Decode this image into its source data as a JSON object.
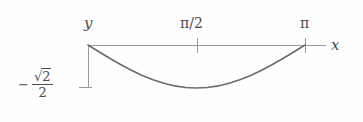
{
  "figure": {
    "background_color": "#fefefe",
    "axis_color": "#9a9a9a",
    "curve_color": "#6b6b6b",
    "text_color": "#4a4a4a"
  },
  "labels": {
    "y_axis": "y",
    "x_axis": "x",
    "tick_pi_half": "π/2",
    "tick_pi": "π",
    "min_value_minus": "−",
    "min_value_numerator_radical": "√",
    "min_value_numerator_arg": "2",
    "min_value_denominator": "2"
  },
  "chart_data": {
    "type": "line",
    "title": "",
    "xlabel": "x",
    "ylabel": "y",
    "xlim": [
      0,
      3.14159
    ],
    "ylim": [
      -0.7071,
      0
    ],
    "grid": false,
    "legend": "none",
    "xticks": [
      1.5708,
      3.14159
    ],
    "xticklabels": [
      "π/2",
      "π"
    ],
    "yticks": [
      -0.7071
    ],
    "yticklabels": [
      "−√2/2"
    ],
    "annotations": [
      {
        "text": "y",
        "x": 0,
        "y": 0,
        "position": "above-left-of-origin"
      },
      {
        "text": "x",
        "x": 3.4,
        "y": 0,
        "position": "right-of-axis-end"
      }
    ],
    "series": [
      {
        "name": "curve",
        "equation": "y = -(sqrt(2)/2) * sin(x)",
        "x": [
          0.0,
          0.1571,
          0.3142,
          0.4712,
          0.6283,
          0.7854,
          0.9425,
          1.0996,
          1.2566,
          1.4137,
          1.5708,
          1.7279,
          1.885,
          2.042,
          2.1991,
          2.3562,
          2.5133,
          2.6704,
          2.8274,
          2.9845,
          3.1416
        ],
        "y": [
          0.0,
          -0.1106,
          -0.2185,
          -0.3209,
          -0.4156,
          -0.5,
          -0.5721,
          -0.6303,
          -0.6728,
          -0.6993,
          -0.7071,
          -0.6993,
          -0.6728,
          -0.6303,
          -0.5721,
          -0.5,
          -0.4156,
          -0.3209,
          -0.2185,
          -0.1106,
          0.0
        ]
      }
    ]
  },
  "geometry": {
    "origin_px": [
      88,
      45
    ],
    "x_axis_end_px": [
      326,
      45
    ],
    "pi_tick_px": 305,
    "pi_half_tick_px": 197,
    "min_y_px": 88
  }
}
